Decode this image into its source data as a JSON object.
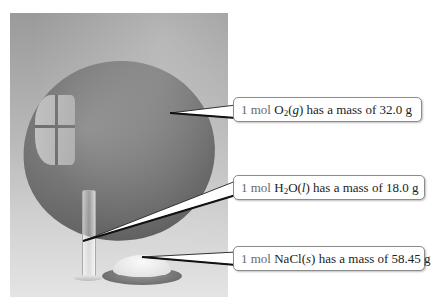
{
  "figure": {
    "callouts": [
      {
        "id": "o2",
        "quantity": "1 mol",
        "formula_main": "O",
        "formula_sub": "2",
        "phase": "(g)",
        "phase_letter": "g",
        "suffix": "has a mass of 32.0 g",
        "mass": "32.0 g",
        "target": "balloon"
      },
      {
        "id": "h2o",
        "quantity": "1 mol",
        "formula_main": "H",
        "formula_sub": "2",
        "formula_rest": "O",
        "phase_letter": "l",
        "suffix": "has a mass of 18.0 g",
        "mass": "18.0 g",
        "target": "graduated-cylinder"
      },
      {
        "id": "nacl",
        "quantity": "1 mol",
        "formula_main": "NaCl",
        "phase_letter": "s",
        "suffix": "has a mass of 58.45 g",
        "mass": "58.45 g",
        "target": "salt-dish"
      }
    ]
  }
}
